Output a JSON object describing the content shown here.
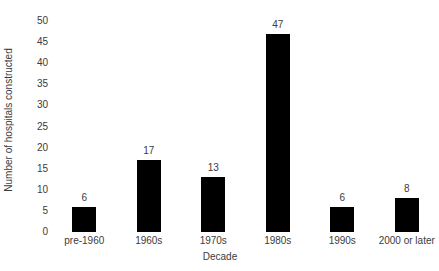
{
  "chart_data": {
    "type": "bar",
    "title": "",
    "subtitle": "",
    "xlabel": "Decade",
    "ylabel": "Number of hospitals constructed",
    "categories": [
      "pre-1960",
      "1960s",
      "1970s",
      "1980s",
      "1990s",
      "2000 or later"
    ],
    "values": [
      6,
      17,
      13,
      47,
      6,
      8
    ],
    "data_labels": [
      "6",
      "17",
      "13",
      "47",
      "6",
      "8"
    ],
    "ylim": [
      0,
      55
    ],
    "ytick_values": [
      0,
      5,
      10,
      15,
      20,
      25,
      30,
      35,
      40,
      45,
      50,
      55
    ],
    "ytick_labels": [
      "0",
      "5",
      "10",
      "15",
      "20",
      "25",
      "30",
      "35",
      "40",
      "45",
      "50",
      "55"
    ],
    "ytick_top_clipped": true,
    "grid": false,
    "axis_lines": false,
    "legend": null,
    "bar_color": "#000000",
    "text_color": "#3b3b3b",
    "background_color": "#ffffff"
  }
}
